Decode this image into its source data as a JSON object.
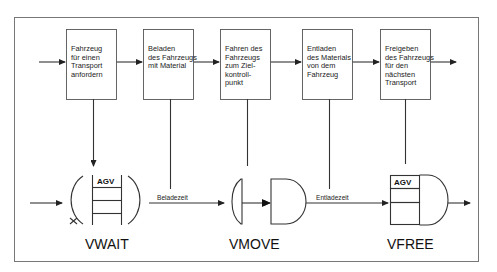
{
  "diagram": {
    "process_steps": [
      {
        "lines": [
          "Fahrzeug",
          "für einen",
          "Transport",
          "anfordern"
        ]
      },
      {
        "lines": [
          "Beladen",
          "des Fahrzeugs",
          "mit Material"
        ]
      },
      {
        "lines": [
          "Fahren des",
          "Fahrzeugs",
          "zum Ziel-",
          "kontroll-",
          "punkt"
        ]
      },
      {
        "lines": [
          "Entladen",
          "des Materials",
          "von dem",
          "Fahrzeug"
        ]
      },
      {
        "lines": [
          "Freigeben",
          "des Fahrzeugs",
          "für den",
          "nächsten",
          "Transport"
        ]
      }
    ],
    "nodes": {
      "vwait": {
        "label": "VWAIT",
        "queue_label": "AGV"
      },
      "vmove": {
        "label": "VMOVE"
      },
      "vfree": {
        "label": "VFREE",
        "queue_label": "AGV"
      }
    },
    "edges": {
      "beladezeit": "Beladezeit",
      "entladezeit": "Entladezeit"
    },
    "colors": {
      "line": "#333333",
      "box_border": "#555555",
      "background": "#ffffff"
    }
  }
}
